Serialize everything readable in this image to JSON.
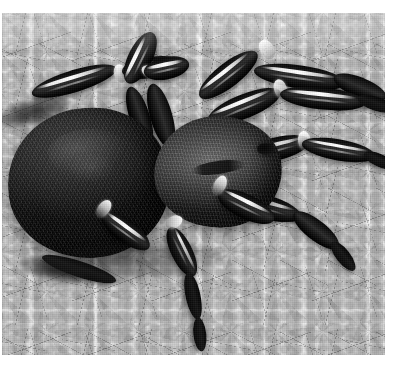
{
  "image": {
    "kind": "photograph",
    "subject": "tarantula spider",
    "color_mode": "black-and-white",
    "caption": "",
    "alt_text": "Black and white photograph of a large hairy tarantula standing on pale gravel",
    "plate": {
      "left": 2,
      "top": 13,
      "width": 383,
      "height": 342
    },
    "palette": {
      "background_paper": "#ffffff",
      "gravel_light": "#f4f4f2",
      "gravel_mid": "#c9c9c5",
      "gravel_shadow": "#4a4a46",
      "spider_body_dark": "#141413",
      "spider_carapace_mid": "#5e5e58",
      "leg_highlight": "#f6f6f1"
    },
    "subject_parts": [
      {
        "name": "abdomen",
        "description": "large dark hairy opisthosoma on the left"
      },
      {
        "name": "carapace",
        "description": "lighter gray cephalothorax at center with dark fovea"
      },
      {
        "name": "eyes",
        "description": "small dark eye tubercle on the carapace"
      },
      {
        "name": "legs",
        "description": "eight dark banded legs with bright white highlight stripes"
      },
      {
        "name": "substrate",
        "description": "pale angular gravel chips with dark crevices"
      }
    ]
  }
}
